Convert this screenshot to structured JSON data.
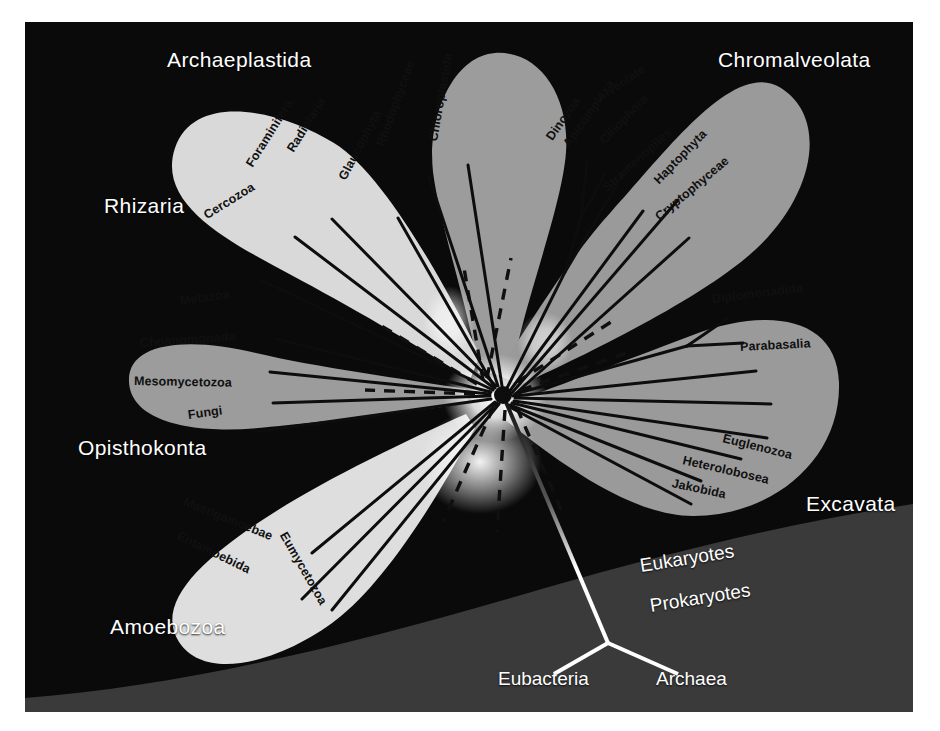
{
  "figure": {
    "background_color": "#0a0a0a",
    "prokaryote_band_color": "#3a3a3a",
    "border_color": "#ffffff"
  },
  "domains": [
    {
      "id": "eukaryotes",
      "label": "Eukaryotes",
      "x": 640,
      "y": 566,
      "rotate": -9
    },
    {
      "id": "prokaryotes",
      "label": "Prokaryotes",
      "x": 650,
      "y": 606,
      "rotate": -9
    }
  ],
  "root": {
    "hub": {
      "x": 478,
      "y": 373
    },
    "junction": {
      "x": 608,
      "y": 643
    },
    "color": "#ffffff",
    "tips": [
      {
        "id": "eubacteria",
        "label": "Eubacteria",
        "x": 554,
        "y": 674,
        "label_x": 498,
        "label_y": 679
      },
      {
        "id": "archaea",
        "label": "Archaea",
        "x": 678,
        "y": 674,
        "label_x": 656,
        "label_y": 679
      }
    ]
  },
  "supergroups": [
    {
      "id": "archaeplastida",
      "label": "Archaeplastida",
      "label_x": 167,
      "label_y": 60,
      "lobe_color": "#9c9c9c",
      "taxa": [
        {
          "name": "Glaucophyta",
          "label_x": 342,
          "label_y": 183,
          "rotate": -62,
          "tip_x": 373,
          "tip_y": 196
        },
        {
          "name": "Rhodophyceae",
          "label_x": 380,
          "label_y": 150,
          "rotate": -70,
          "tip_x": 404,
          "tip_y": 155
        },
        {
          "name": "Chloroplastida",
          "label_x": 433,
          "label_y": 145,
          "rotate": -80,
          "tip_x": 443,
          "tip_y": 143
        }
      ]
    },
    {
      "id": "chromalveolata",
      "label": "Chromalveolata",
      "label_x": 718,
      "label_y": 60,
      "lobe_color": "#9a9a9a",
      "group_labels": [
        {
          "name": "Alveolate",
          "label_x": 598,
          "label_y": 103,
          "rotate": -34
        }
      ],
      "taxa": [
        {
          "name": "Dinozoa",
          "label_x": 549,
          "label_y": 143,
          "rotate": -55,
          "tip_x": 562,
          "tip_y": 139
        },
        {
          "name": "Apicomplexa",
          "label_x": 566,
          "label_y": 150,
          "rotate": -55,
          "tip_x": 580,
          "tip_y": 152
        },
        {
          "name": "Ciliophora",
          "label_x": 602,
          "label_y": 146,
          "rotate": -46,
          "tip_x": 604,
          "tip_y": 142
        },
        {
          "name": "Stramenopiles",
          "label_x": 605,
          "label_y": 193,
          "rotate": -42,
          "tip_x": 618,
          "tip_y": 189
        },
        {
          "name": "Haptophyta",
          "label_x": 656,
          "label_y": 186,
          "rotate": -46,
          "tip_x": 653,
          "tip_y": 178
        },
        {
          "name": "Cryptophyceae",
          "label_x": 657,
          "label_y": 222,
          "rotate": -40,
          "tip_x": 664,
          "tip_y": 216
        }
      ]
    },
    {
      "id": "rhizaria",
      "label": "Rhizaria",
      "label_x": 104,
      "label_y": 205,
      "lobe_color": "#d9d9d9",
      "taxa": [
        {
          "name": "Cercozoa",
          "label_x": 205,
          "label_y": 220,
          "rotate": -32,
          "tip_x": 236,
          "tip_y": 258
        },
        {
          "name": "Foraminifera",
          "label_x": 249,
          "label_y": 170,
          "rotate": -58,
          "tip_x": 270,
          "tip_y": 215
        },
        {
          "name": "Radiolaria",
          "label_x": 290,
          "label_y": 155,
          "rotate": -58,
          "tip_x": 307,
          "tip_y": 197
        }
      ]
    },
    {
      "id": "opisthokonta",
      "label": "Opisthokonta",
      "label_x": 78,
      "label_y": 447,
      "lobe_color": "#9c9c9c",
      "taxa": [
        {
          "name": "Metazoa",
          "label_x": 180,
          "label_y": 305,
          "rotate": -8,
          "tip_x": 252,
          "tip_y": 317
        },
        {
          "name": "Choanomonada",
          "label_x": 140,
          "label_y": 347,
          "rotate": -4,
          "tip_x": 245,
          "tip_y": 350
        },
        {
          "name": "Mesomycetozoa",
          "label_x": 134,
          "label_y": 385,
          "rotate": 1,
          "tip_x": 248,
          "tip_y": 381
        },
        {
          "name": "Fungi",
          "label_x": 188,
          "label_y": 419,
          "rotate": -8,
          "tip_x": 230,
          "tip_y": 410
        }
      ]
    },
    {
      "id": "amoebozoa",
      "label": "Amoebozoa",
      "label_x": 110,
      "label_y": 626,
      "lobe_color": "#dedede",
      "taxa": [
        {
          "name": "Mastigamoebae",
          "label_x": 184,
          "label_y": 505,
          "rotate": 22,
          "tip_x": 287,
          "tip_y": 531
        },
        {
          "name": "Entamoebida",
          "label_x": 178,
          "label_y": 539,
          "rotate": 26,
          "tip_x": 277,
          "tip_y": 577
        },
        {
          "name": "Eumycetozoa",
          "label_x": 283,
          "label_y": 537,
          "rotate": 60,
          "tip_x": 307,
          "tip_y": 588
        }
      ]
    },
    {
      "id": "excavata",
      "label": "Excavata",
      "label_x": 806,
      "label_y": 503,
      "lobe_color": "#9a9a9a",
      "taxa": [
        {
          "name": "Diplomonadida",
          "label_x": 712,
          "label_y": 303,
          "rotate": -7,
          "tip_x": 703,
          "tip_y": 296
        },
        {
          "name": "Parabasalia",
          "label_x": 740,
          "label_y": 351,
          "rotate": -3,
          "tip_x": 731,
          "tip_y": 349
        },
        {
          "name": "Euglenozoa",
          "label_x": 723,
          "label_y": 442,
          "rotate": 14,
          "tip_x": 716,
          "tip_y": 437
        },
        {
          "name": "Heterolobosea",
          "label_x": 683,
          "label_y": 464,
          "rotate": 13,
          "tip_x": 676,
          "tip_y": 459
        },
        {
          "name": "Jakobida",
          "label_x": 672,
          "label_y": 487,
          "rotate": 12,
          "tip_x": 666,
          "tip_y": 482
        }
      ]
    }
  ]
}
